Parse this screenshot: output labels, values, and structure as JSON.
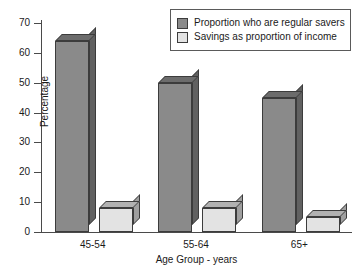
{
  "chart_data": {
    "type": "bar",
    "title": "",
    "subtitle": "",
    "xlabel": "Age Group - years",
    "ylabel": "Percentage",
    "categories": [
      "45-54",
      "55-64",
      "65+"
    ],
    "series": [
      {
        "name": "Proportion who are regular savers",
        "color": "#8a8a8a",
        "values": [
          64,
          50,
          45
        ]
      },
      {
        "name": "Savings as proportion of income",
        "color": "#e3e3e3",
        "values": [
          8,
          8,
          5
        ]
      }
    ],
    "ylim": [
      0,
      70
    ],
    "ytick_step": 10,
    "yticks": [
      0,
      10,
      20,
      30,
      40,
      50,
      60,
      70
    ],
    "ytick_labels": [
      "0",
      "10",
      "20",
      "30",
      "40",
      "50",
      "60",
      "70"
    ],
    "grid": false,
    "legend_position": "top-right",
    "style": "3d-blocks",
    "annotations": []
  },
  "legend": {
    "entries": [
      {
        "label": "Proportion who are regular savers",
        "swatch": "#8a8a8a"
      },
      {
        "label": "Savings as proportion of income",
        "swatch": "#e3e3e3"
      }
    ]
  }
}
